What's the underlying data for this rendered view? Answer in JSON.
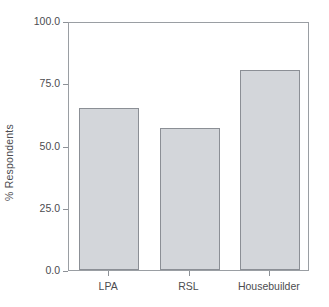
{
  "chart_data": {
    "type": "bar",
    "title": "",
    "subtitle": "",
    "xlabel": "",
    "ylabel": "% Respondents",
    "categories": [
      "LPA",
      "RSL",
      "Housebuilder"
    ],
    "values": [
      65.0,
      57.0,
      80.5
    ],
    "series": [
      {
        "name": "% Respondents",
        "values": [
          65.0,
          57.0,
          80.5
        ]
      }
    ],
    "ylim": [
      0.0,
      100.0
    ],
    "yticks": [
      0.0,
      25.0,
      50.0,
      75.0,
      100.0
    ],
    "ytick_labels": [
      "0.0",
      "25.0",
      "50.0",
      "75.0",
      "100.0"
    ],
    "grid": false,
    "legend": false,
    "legend_position": "none",
    "annotations": [],
    "bar_fill_color": "#d3d6da",
    "bar_edge_color": "#8b8f95",
    "axis_color": "#9a9ea3",
    "text_color": "#4c4c50",
    "background_color": "#ffffff"
  }
}
